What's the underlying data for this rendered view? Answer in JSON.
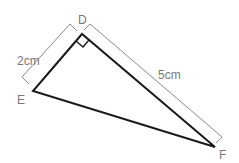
{
  "diagram": {
    "type": "right-triangle",
    "vertices": {
      "D": {
        "label": "D",
        "x": 82,
        "y": 34
      },
      "E": {
        "label": "E",
        "x": 33,
        "y": 91
      },
      "F": {
        "label": "F",
        "x": 215,
        "y": 147
      }
    },
    "right_angle_at": "D",
    "dimensions": [
      {
        "side": "DE",
        "label": "2cm"
      },
      {
        "side": "DF",
        "label": "5cm"
      }
    ],
    "colors": {
      "triangle": "#1a1a1a",
      "dimension_line": "#8a8a8a",
      "label": "#777777"
    }
  }
}
